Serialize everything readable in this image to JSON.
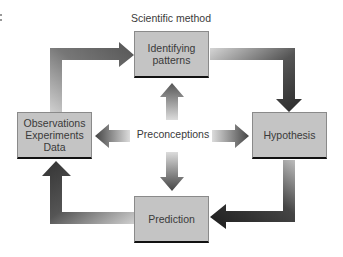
{
  "diagram": {
    "title": "Scientific method",
    "nodes": {
      "top": "Identifying\npatterns",
      "right": "Hypothesis",
      "bottom": "Prediction",
      "left": "Observations\nExperiments\nData"
    },
    "center_label": "Preconceptions",
    "cycle_edges": [
      {
        "from": "Observations Experiments Data",
        "to": "Identifying patterns"
      },
      {
        "from": "Identifying patterns",
        "to": "Hypothesis"
      },
      {
        "from": "Hypothesis",
        "to": "Prediction"
      },
      {
        "from": "Prediction",
        "to": "Observations Experiments Data"
      }
    ],
    "center_edges": [
      {
        "from": "Preconceptions",
        "to": "Identifying patterns"
      },
      {
        "from": "Preconceptions",
        "to": "Hypothesis"
      },
      {
        "from": "Preconceptions",
        "to": "Prediction"
      },
      {
        "from": "Preconceptions",
        "to": "Observations Experiments Data"
      }
    ],
    "colors": {
      "box_fill": "#c4c4c4",
      "box_shadow": "#111111",
      "arrow_dark": "#3a3a3a",
      "arrow_light": "#d8d8d8"
    }
  }
}
